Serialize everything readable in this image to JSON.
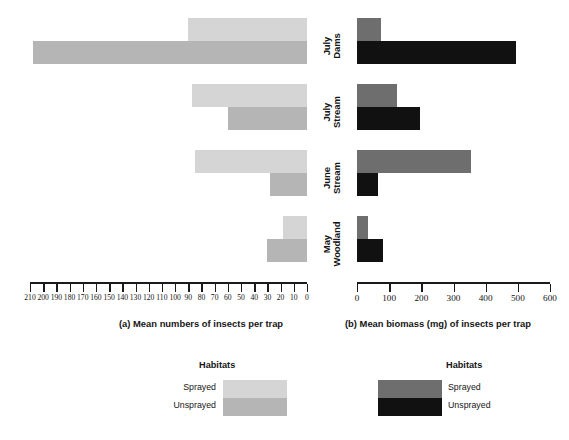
{
  "chart_data": {
    "type": "bar",
    "orientation": "horizontal",
    "title": "",
    "categories": [
      "July Dams",
      "July Stream",
      "June Stream",
      "May Woodland"
    ],
    "category_lines": [
      [
        "July",
        "Dams"
      ],
      [
        "July",
        "Stream"
      ],
      [
        "June",
        "Stream"
      ],
      [
        "May",
        "Woodland"
      ]
    ],
    "legend": {
      "title": "Habitats",
      "entries": [
        "Sprayed",
        "Unsprayed"
      ],
      "position": "below-plot"
    },
    "panels": [
      {
        "id": "a",
        "label": "(a)",
        "caption": "(a)  Mean numbers of insects per trap",
        "xlabel": "Mean numbers of insects per trap",
        "ylabel": "",
        "xlim": [
          210,
          0
        ],
        "axis_direction": "reversed",
        "tick_step": 10,
        "tick_labels": [
          "210",
          "200",
          "190",
          "180",
          "170",
          "160",
          "150",
          "140",
          "130",
          "120",
          "110",
          "100",
          "90",
          "80",
          "70",
          "60",
          "50",
          "40",
          "30",
          "20",
          "10",
          "0"
        ],
        "tick_values": [
          210,
          200,
          190,
          180,
          170,
          160,
          150,
          140,
          130,
          120,
          110,
          100,
          90,
          80,
          70,
          60,
          50,
          40,
          30,
          20,
          10,
          0
        ],
        "grid": false,
        "series": [
          {
            "name": "Sprayed",
            "color": "#d5d5d5",
            "values": [
              90,
              87,
              85,
              18
            ]
          },
          {
            "name": "Unsprayed",
            "color": "#b5b5b5",
            "values": [
              208,
              60,
              28,
              30
            ]
          }
        ]
      },
      {
        "id": "b",
        "label": "(b)",
        "caption": "(b)  Mean biomass (mg) of insects per trap",
        "xlabel": "Mean biomass (mg) of insects per trap",
        "ylabel": "",
        "xlim": [
          0,
          600
        ],
        "axis_direction": "normal",
        "tick_step": 100,
        "tick_labels": [
          "0",
          "100",
          "200",
          "300",
          "400",
          "500",
          "600"
        ],
        "tick_values": [
          0,
          100,
          200,
          300,
          400,
          500,
          600
        ],
        "grid": false,
        "series": [
          {
            "name": "Sprayed",
            "color": "#6e6e6e",
            "values": [
              75,
              125,
              355,
              35
            ]
          },
          {
            "name": "Unsprayed",
            "color": "#111111",
            "values": [
              495,
              195,
              65,
              80
            ]
          }
        ]
      }
    ]
  },
  "colors": {
    "sprayed_left": "#d5d5d5",
    "unsprayed_left": "#b5b5b5",
    "sprayed_right": "#6e6e6e",
    "unsprayed_right": "#111111",
    "axis": "#1a1a1a",
    "text": "#161616",
    "background": "#ffffff"
  }
}
